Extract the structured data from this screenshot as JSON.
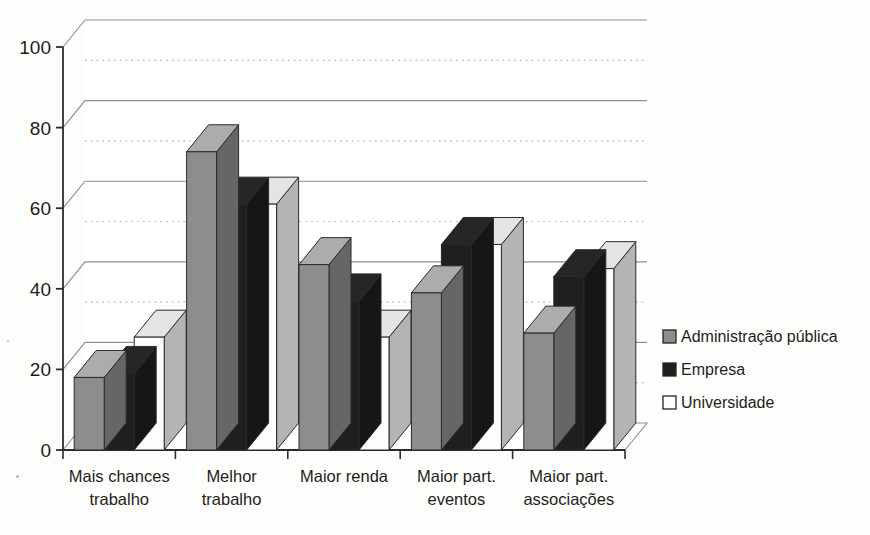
{
  "chart_data": {
    "type": "bar",
    "title": "",
    "subtitle": "",
    "xlabel": "",
    "ylabel": "",
    "ylim": [
      0,
      100
    ],
    "yticks": [
      0,
      20,
      40,
      60,
      80,
      100
    ],
    "minor_gridlines": [
      10,
      30,
      50,
      70,
      90
    ],
    "grid": true,
    "style": "3d-clustered-column",
    "legend_position": "right",
    "categories": [
      "Mais chances trabalho",
      "Melhor trabalho",
      "Maior renda",
      "Maior part. eventos",
      "Maior part. associações"
    ],
    "category_lines": [
      [
        "Mais chances",
        "trabalho"
      ],
      [
        "Melhor",
        "trabalho"
      ],
      [
        "Maior renda",
        ""
      ],
      [
        "Maior part.",
        "eventos"
      ],
      [
        "Maior part.",
        "associações"
      ]
    ],
    "series": [
      {
        "name": "Administração pública",
        "color": "#8d8d8d",
        "values": [
          18,
          74,
          46,
          39,
          29
        ]
      },
      {
        "name": "Empresa",
        "color": "#1f1f1f",
        "values": [
          19,
          61,
          37,
          51,
          43
        ]
      },
      {
        "name": "Universidade",
        "color": "#fdfdfd",
        "values": [
          28,
          61,
          28,
          51,
          45
        ]
      }
    ]
  },
  "axis": {
    "y_tick_labels": [
      "0",
      "20",
      "40",
      "60",
      "80",
      "100"
    ]
  },
  "legend": {
    "items": [
      {
        "label": "Administração pública",
        "swatch": "gray"
      },
      {
        "label": "Empresa",
        "swatch": "black"
      },
      {
        "label": "Universidade",
        "swatch": "white"
      }
    ]
  },
  "colors": {
    "series_gray": "#8d8d8d",
    "series_black": "#1f1f1f",
    "series_white": "#fdfdfd",
    "gridline": "#8e8e8e",
    "minor_gridline": "#b0b0b0",
    "axis": "#2b2b2b",
    "background": "#fdfdfb"
  }
}
